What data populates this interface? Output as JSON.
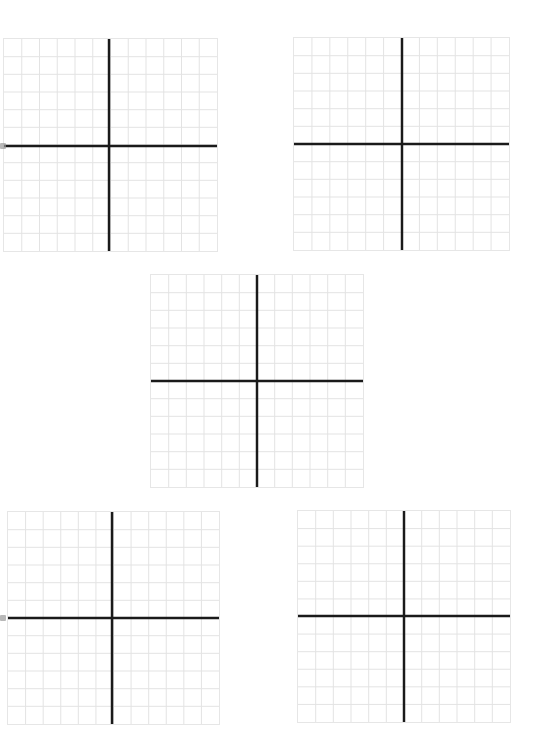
{
  "page": {
    "type": "coordinate-plane-worksheet",
    "background": "#ffffff"
  },
  "style": {
    "grid_line_color": "#e3e3e3",
    "axis_color": "#1a1a1a",
    "border_color": "#e6e6e6",
    "axis_width": 2.5,
    "grid_line_width": 1
  },
  "planes": [
    {
      "id": "plane-1",
      "left": 3,
      "top": 38,
      "width": 215,
      "height": 214,
      "cells_x": 12,
      "cells_y": 12,
      "axis_x": 109,
      "axis_y": 146
    },
    {
      "id": "plane-2",
      "left": 293,
      "top": 37,
      "width": 217,
      "height": 214,
      "cells_x": 12,
      "cells_y": 12,
      "axis_x": 402,
      "axis_y": 144
    },
    {
      "id": "plane-3",
      "left": 150,
      "top": 274,
      "width": 214,
      "height": 214,
      "cells_x": 12,
      "cells_y": 12,
      "axis_x": 257,
      "axis_y": 381
    },
    {
      "id": "plane-4",
      "left": 7,
      "top": 511,
      "width": 213,
      "height": 214,
      "cells_x": 12,
      "cells_y": 12,
      "axis_x": 112,
      "axis_y": 618
    },
    {
      "id": "plane-5",
      "left": 297,
      "top": 510,
      "width": 214,
      "height": 213,
      "cells_x": 12,
      "cells_y": 12,
      "axis_x": 404,
      "axis_y": 616
    }
  ],
  "edge_marks": [
    {
      "left": 0,
      "top": 143
    },
    {
      "left": 0,
      "top": 615
    }
  ]
}
